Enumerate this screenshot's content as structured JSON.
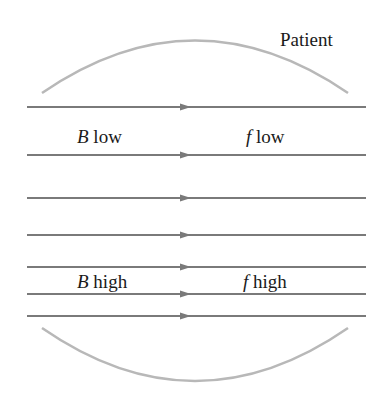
{
  "diagram": {
    "title_label": "Patient",
    "labels": {
      "b_low_var": "B",
      "b_low_text": " low",
      "f_low_var": "f",
      "f_low_text": " low",
      "b_high_var": "B",
      "b_high_text": " high",
      "f_high_var": "f",
      "f_high_text": " high"
    },
    "field_lines_y": [
      107,
      155,
      198,
      235,
      267,
      294,
      316
    ],
    "line_color": "#7a7a7a",
    "arc_color": "#b8b8b8",
    "direction": "left-to-right"
  }
}
